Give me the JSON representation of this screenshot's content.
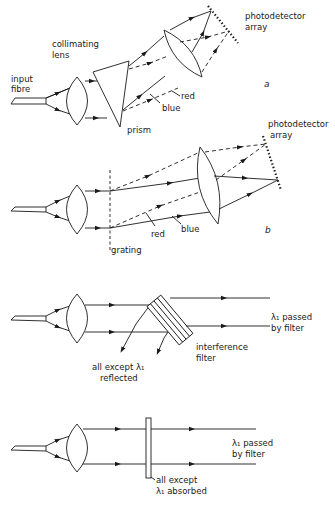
{
  "diagram": {
    "panels": [
      {
        "id": "a",
        "label": "a",
        "type": "prism spectrometer",
        "labels": {
          "input": "input fibre",
          "lens_line1": "collimating",
          "lens_line2": "lens",
          "prism": "prism",
          "red": "red",
          "blue": "blue",
          "detector_line1": "photodetector",
          "detector_line2": "array"
        }
      },
      {
        "id": "b",
        "label": "b",
        "type": "grating spectrometer",
        "labels": {
          "grating": "grating",
          "red": "red",
          "blue": "blue",
          "detector_line1": "photodetector",
          "detector_line2": "array"
        }
      },
      {
        "id": "c",
        "type": "interference filter",
        "labels": {
          "passed_line1": "λ₁ passed",
          "passed_line2": "by filter",
          "filter_line1": "interference",
          "filter_line2": "filter",
          "reflected_line1": "all except λ₁",
          "reflected_line2": "reflected"
        }
      },
      {
        "id": "d",
        "type": "absorption filter",
        "labels": {
          "passed_line1": "λ₁ passed",
          "passed_line2": "by filter",
          "absorbed_line1": "all except",
          "absorbed_line2": "λ₁ absorbed"
        }
      }
    ]
  }
}
